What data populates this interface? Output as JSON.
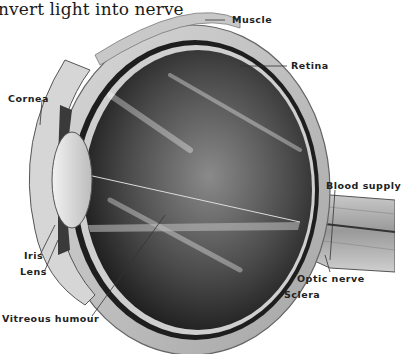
{
  "title": "nvert light into nerve",
  "labels": {
    "muscle": "Muscle",
    "retina": "Retina",
    "cornea": "Cornea",
    "blood_supply": "Blood supply",
    "iris": "Iris",
    "lens": "Lens",
    "optic_nerve": "Optic nerve",
    "sclera": "Sclera",
    "vitreous_humour": "Vitreous humour"
  },
  "colors": {
    "background": "#ffffff",
    "sclera": "#bdbdbd",
    "choroid": "#1e1e1e",
    "vitreous_dark": "#2b2b2b",
    "vitreous_light": "#9a9a9a",
    "lens": "#d9d9d9",
    "label_text": "#222222"
  }
}
